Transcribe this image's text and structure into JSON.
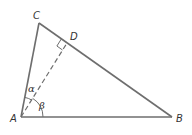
{
  "diagram": {
    "type": "right-triangle-with-altitude",
    "colors": {
      "stroke": "#6e6e6e",
      "text": "#333333",
      "background": "#ffffff"
    },
    "vertices": {
      "A": {
        "label": "A",
        "x": 21,
        "y": 117
      },
      "B": {
        "label": "B",
        "x": 172,
        "y": 117
      },
      "C": {
        "label": "C",
        "x": 39,
        "y": 23
      },
      "D": {
        "label": "D",
        "x": 67,
        "y": 43
      }
    },
    "angles": {
      "alpha": {
        "label": "α",
        "between": "AC and AD"
      },
      "beta": {
        "label": "β",
        "between": "AD and AB"
      }
    },
    "segments": [
      {
        "from": "A",
        "to": "B",
        "style": "solid"
      },
      {
        "from": "A",
        "to": "C",
        "style": "solid"
      },
      {
        "from": "C",
        "to": "B",
        "style": "solid"
      },
      {
        "from": "A",
        "to": "D",
        "style": "dashed",
        "note": "perpendicular to CB"
      }
    ],
    "right_angle_marker": "D"
  }
}
